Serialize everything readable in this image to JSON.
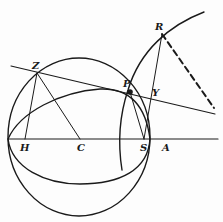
{
  "diagram": {
    "type": "geometric-construction",
    "colors": {
      "stroke": "#1a1a1a",
      "background": "#fdfdfd"
    },
    "labels": {
      "Z": "Z",
      "P": "P",
      "R": "R",
      "Y": "Y",
      "H": "H",
      "C": "C",
      "S": "S",
      "A": "A"
    },
    "points": {
      "Z": [
        37,
        73
      ],
      "P": [
        130,
        92
      ],
      "R": [
        162,
        34
      ],
      "Y": [
        150,
        100
      ],
      "H": [
        25,
        139
      ],
      "C": [
        80,
        139
      ],
      "S": [
        144,
        139
      ],
      "A": [
        150,
        139
      ]
    },
    "elements": [
      "sphere outline",
      "tilted great-circle ellipse",
      "large arc through R",
      "horizontal axis H-C-S-A",
      "line through Z, P, Y",
      "segment Z-H",
      "segment Z-C",
      "segment P-S",
      "segment R-S",
      "dashed line from R"
    ]
  }
}
